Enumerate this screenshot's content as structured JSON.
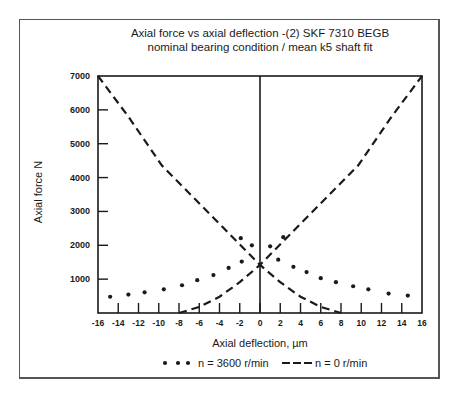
{
  "chart_data": {
    "type": "line",
    "title": "Axial force vs axial deflection -(2) SKF 7310 BEGB",
    "subtitle": "nominal bearing condition / mean k5 shaft fit",
    "xlabel": "Axial deflection, µm",
    "ylabel": "Axial force N",
    "xlim": [
      -16,
      16
    ],
    "ylim": [
      0,
      7000
    ],
    "x_ticks": [
      -16,
      -14,
      -12,
      -10,
      -8,
      -6,
      -4,
      -2,
      0,
      2,
      4,
      6,
      8,
      10,
      12,
      14,
      16
    ],
    "y_ticks": [
      1000,
      2000,
      3000,
      4000,
      5000,
      6000,
      7000
    ],
    "grid": false,
    "legend_position": "bottom",
    "series": [
      {
        "name": "n = 3600 r/min",
        "style": "dotted-markers",
        "points": [
          [
            -14.8,
            480
          ],
          [
            -13.0,
            545
          ],
          [
            -11.4,
            610
          ],
          [
            -9.5,
            700
          ],
          [
            -7.7,
            820
          ],
          [
            -6.2,
            970
          ],
          [
            -4.6,
            1120
          ],
          [
            -3.1,
            1330
          ],
          [
            -1.8,
            1520
          ],
          [
            -1.9,
            2210
          ],
          [
            -0.8,
            2000
          ],
          [
            1.0,
            1970
          ],
          [
            2.3,
            2240
          ],
          [
            1.8,
            1575
          ],
          [
            3.3,
            1365
          ],
          [
            4.6,
            1210
          ],
          [
            6.0,
            1030
          ],
          [
            7.5,
            910
          ],
          [
            9.2,
            790
          ],
          [
            10.7,
            700
          ],
          [
            12.7,
            575
          ],
          [
            14.6,
            515
          ]
        ]
      },
      {
        "name": "n = 0 r/min (left curve)",
        "style": "dashed",
        "points": [
          [
            -16,
            7000
          ],
          [
            -13,
            5800
          ],
          [
            -9.7,
            4360
          ],
          [
            -6.4,
            3360
          ],
          [
            -3.1,
            2360
          ],
          [
            0,
            1420
          ],
          [
            2,
            910
          ],
          [
            4,
            480
          ],
          [
            6,
            180
          ],
          [
            8,
            0
          ]
        ]
      },
      {
        "name": "n = 0 r/min (right curve)",
        "style": "dashed",
        "points": [
          [
            -8,
            0
          ],
          [
            -6,
            180
          ],
          [
            -4,
            480
          ],
          [
            -2,
            910
          ],
          [
            0,
            1420
          ],
          [
            3.1,
            2360
          ],
          [
            6.4,
            3360
          ],
          [
            9.7,
            4360
          ],
          [
            13,
            5800
          ],
          [
            16,
            7000
          ]
        ]
      }
    ],
    "vertical_reference_line_x": 0
  },
  "text": {
    "title": "Axial force vs axial deflection -(2) SKF 7310 BEGB",
    "subtitle": "nominal bearing condition / mean k5 shaft fit",
    "ylabel": "Axial force N",
    "xlabel": "Axial deflection, µm",
    "legend_dots": "n = 3600 r/min",
    "legend_dashed": "n = 0 r/min"
  },
  "colors": {
    "ink": "#1a1a1a",
    "frame": "#555555",
    "background": "#ffffff"
  }
}
